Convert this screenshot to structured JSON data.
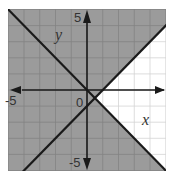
{
  "chart_data": {
    "type": "line",
    "title": "",
    "subtitle": "System of linear inequalities — shaded solution region",
    "xlabel": "x",
    "ylabel": "y",
    "xlim": [
      -5,
      5
    ],
    "ylim": [
      -5,
      5
    ],
    "grid": true,
    "grid_step": 1,
    "legend": null,
    "tick_labels": {
      "x": [
        {
          "value": -5,
          "label": "-5"
        },
        {
          "value": 0,
          "label": "0"
        }
      ],
      "y": [
        {
          "value": 5,
          "label": "5"
        },
        {
          "value": -5,
          "label": "-5"
        }
      ]
    },
    "series": [
      {
        "name": "boundary line 1",
        "equation": "y = -x",
        "slope": -1,
        "intercept": 0,
        "points": [
          [
            -5,
            5
          ],
          [
            5,
            -5
          ]
        ],
        "style": "solid"
      },
      {
        "name": "boundary line 2",
        "equation": "y = x - 1",
        "slope": 1,
        "intercept": -1,
        "points": [
          [
            -4,
            -5
          ],
          [
            5,
            4
          ]
        ],
        "style": "solid"
      }
    ],
    "intersection": [
      0.5,
      -0.5
    ],
    "unshaded_region": "right wedge between the two lines (x > 0.5, y < x - 1 and y > -x)",
    "shaded_region": "all of the plane except the right wedge",
    "colors": {
      "shade": "#9b9b9b",
      "shade_grid": "#838383",
      "white_grid": "#d4d4d4",
      "lines": "#1a1a1a",
      "axes": "#1a1a1a"
    }
  },
  "labels": {
    "x_axis": "x",
    "y_axis": "y",
    "origin": "0",
    "x_min": "-5",
    "y_max": "5",
    "y_min": "-5"
  }
}
